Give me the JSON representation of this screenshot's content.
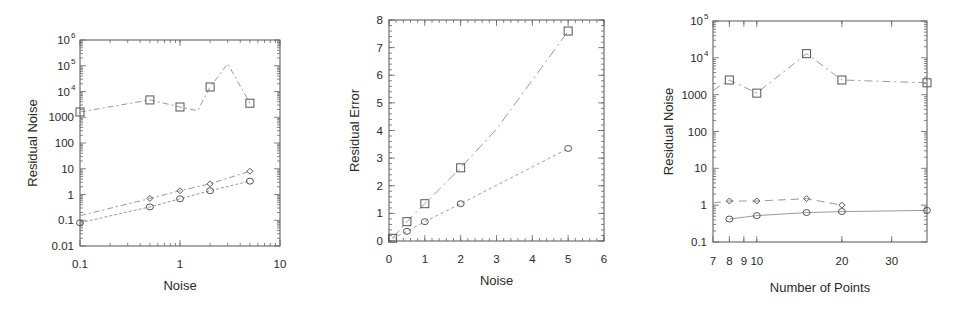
{
  "chart_data": [
    {
      "id": "left",
      "type": "line",
      "title": "",
      "xlabel": "Noise",
      "ylabel": "Residual Noise",
      "xscale": "log",
      "yscale": "log",
      "xlim": [
        0.1,
        10
      ],
      "ylim": [
        0.01,
        1000000
      ],
      "xticks": [
        {
          "v": 0.1,
          "label": "0.1"
        },
        {
          "v": 1,
          "label": "1"
        },
        {
          "v": 10,
          "label": "10"
        }
      ],
      "yticks": [
        {
          "v": 0.01,
          "label": "0.01"
        },
        {
          "v": 0.1,
          "label": "0.1"
        },
        {
          "v": 1,
          "label": "1"
        },
        {
          "v": 10,
          "label": "10"
        },
        {
          "v": 100,
          "label": "100"
        },
        {
          "v": 1000,
          "label": "1000"
        },
        {
          "v": 10000,
          "label": "10",
          "sup": "4"
        },
        {
          "v": 100000,
          "label": "10",
          "sup": "5"
        },
        {
          "v": 1000000,
          "label": "10",
          "sup": "6"
        }
      ],
      "grid": false,
      "legend": null,
      "series": [
        {
          "name": "squares",
          "marker": "square",
          "dash": "6 3 2 3",
          "line": [
            [
              0.1,
              1600
            ],
            [
              0.5,
              4700
            ],
            [
              1,
              2500
            ],
            [
              1.5,
              1800
            ],
            [
              2,
              15000
            ],
            [
              3,
              120000
            ],
            [
              5,
              3500
            ]
          ],
          "points": [
            [
              0.1,
              1600
            ],
            [
              0.5,
              4700
            ],
            [
              1,
              2500
            ],
            [
              2,
              15000
            ],
            [
              5,
              3500
            ]
          ]
        },
        {
          "name": "diamonds",
          "marker": "diamond",
          "dash": "6 3 2 3",
          "line": [
            [
              0.1,
              0.15
            ],
            [
              0.5,
              0.7
            ],
            [
              1,
              1.4
            ],
            [
              2,
              2.6
            ],
            [
              5,
              8
            ]
          ],
          "points": [
            [
              0.5,
              0.7
            ],
            [
              1,
              1.4
            ],
            [
              2,
              2.6
            ],
            [
              5,
              8
            ]
          ]
        },
        {
          "name": "circles",
          "marker": "circle",
          "dash": "3 2",
          "line": [
            [
              0.1,
              0.08
            ],
            [
              0.5,
              0.33
            ],
            [
              1,
              0.68
            ],
            [
              2,
              1.4
            ],
            [
              5,
              3.3
            ]
          ],
          "points": [
            [
              0.1,
              0.08
            ],
            [
              0.5,
              0.33
            ],
            [
              1,
              0.68
            ],
            [
              2,
              1.4
            ],
            [
              5,
              3.3
            ]
          ]
        }
      ],
      "box": {
        "x0": 80,
        "x1": 280,
        "y0": 40,
        "y1": 246
      }
    },
    {
      "id": "middle",
      "type": "line",
      "title": "",
      "xlabel": "Noise",
      "ylabel": "Residual Error",
      "xscale": "linear",
      "yscale": "linear",
      "xlim": [
        0,
        6
      ],
      "ylim": [
        0,
        8
      ],
      "xticks": [
        {
          "v": 0,
          "label": "0"
        },
        {
          "v": 1,
          "label": "1"
        },
        {
          "v": 2,
          "label": "2"
        },
        {
          "v": 3,
          "label": "3"
        },
        {
          "v": 4,
          "label": "4"
        },
        {
          "v": 5,
          "label": "5"
        },
        {
          "v": 6,
          "label": "6"
        }
      ],
      "yticks": [
        {
          "v": 0,
          "label": "0"
        },
        {
          "v": 1,
          "label": "1"
        },
        {
          "v": 2,
          "label": "2"
        },
        {
          "v": 3,
          "label": "3"
        },
        {
          "v": 4,
          "label": "4"
        },
        {
          "v": 5,
          "label": "5"
        },
        {
          "v": 6,
          "label": "6"
        },
        {
          "v": 7,
          "label": "7"
        },
        {
          "v": 8,
          "label": "8"
        }
      ],
      "grid": false,
      "legend": null,
      "series": [
        {
          "name": "squares",
          "marker": "square",
          "dash": "10 4 2 4",
          "line": [
            [
              0.1,
              0.1
            ],
            [
              0.5,
              0.7
            ],
            [
              1,
              1.35
            ],
            [
              2,
              2.65
            ],
            [
              3,
              4.05
            ],
            [
              5,
              7.6
            ]
          ],
          "points": [
            [
              0.1,
              0.1
            ],
            [
              0.5,
              0.7
            ],
            [
              1,
              1.35
            ],
            [
              2,
              2.65
            ],
            [
              5,
              7.6
            ]
          ]
        },
        {
          "name": "circles",
          "marker": "circle",
          "dash": "3 3",
          "line": [
            [
              0.1,
              0.1
            ],
            [
              0.5,
              0.35
            ],
            [
              1,
              0.7
            ],
            [
              2,
              1.35
            ],
            [
              5,
              3.35
            ]
          ],
          "points": [
            [
              0.5,
              0.35
            ],
            [
              1,
              0.7
            ],
            [
              2,
              1.35
            ],
            [
              5,
              3.35
            ]
          ]
        }
      ],
      "box": {
        "x0": 389,
        "x1": 604,
        "y0": 20,
        "y1": 241
      }
    },
    {
      "id": "right",
      "type": "line",
      "title": "",
      "xlabel": "Number of Points",
      "ylabel": "Residual Noise",
      "xscale": "log",
      "yscale": "log",
      "xlim": [
        7,
        40
      ],
      "ylim": [
        0.1,
        100000
      ],
      "xticks": [
        {
          "v": 7,
          "label": "7"
        },
        {
          "v": 8,
          "label": "8"
        },
        {
          "v": 9,
          "label": "9"
        },
        {
          "v": 10,
          "label": "10"
        },
        {
          "v": 20,
          "label": "20"
        },
        {
          "v": 30,
          "label": "30"
        }
      ],
      "yticks": [
        {
          "v": 0.1,
          "label": "0.1"
        },
        {
          "v": 1,
          "label": "1"
        },
        {
          "v": 10,
          "label": "10"
        },
        {
          "v": 100,
          "label": "100"
        },
        {
          "v": 1000,
          "label": "1000"
        },
        {
          "v": 10000,
          "label": "10",
          "sup": "4"
        },
        {
          "v": 100000,
          "label": "10",
          "sup": "5"
        }
      ],
      "grid": false,
      "legend": null,
      "series": [
        {
          "name": "squares",
          "marker": "square",
          "dash": "8 4 2 4",
          "line": [
            [
              7,
              1300
            ],
            [
              8,
              2500
            ],
            [
              10,
              1100
            ],
            [
              15,
              13000
            ],
            [
              20,
              2500
            ],
            [
              40,
              2100
            ]
          ],
          "points": [
            [
              8,
              2500
            ],
            [
              10,
              1100
            ],
            [
              15,
              13000
            ],
            [
              20,
              2500
            ],
            [
              40,
              2100
            ]
          ]
        },
        {
          "name": "diamonds",
          "marker": "diamond",
          "dash": "8 5",
          "line": [
            [
              7,
              1.15
            ],
            [
              8,
              1.3
            ],
            [
              10,
              1.3
            ],
            [
              15,
              1.5
            ],
            [
              20,
              1.0
            ]
          ],
          "points": [
            [
              8,
              1.3
            ],
            [
              10,
              1.3
            ],
            [
              15,
              1.5
            ],
            [
              20,
              1.0
            ]
          ]
        },
        {
          "name": "circles",
          "marker": "circle",
          "dash": "",
          "line": [
            [
              8,
              0.42
            ],
            [
              10,
              0.52
            ],
            [
              15,
              0.63
            ],
            [
              20,
              0.67
            ],
            [
              40,
              0.72
            ]
          ],
          "points": [
            [
              8,
              0.42
            ],
            [
              10,
              0.52
            ],
            [
              15,
              0.63
            ],
            [
              20,
              0.67
            ],
            [
              40,
              0.72
            ]
          ]
        }
      ],
      "box": {
        "x0": 713,
        "x1": 927,
        "y0": 21,
        "y1": 242
      }
    }
  ]
}
